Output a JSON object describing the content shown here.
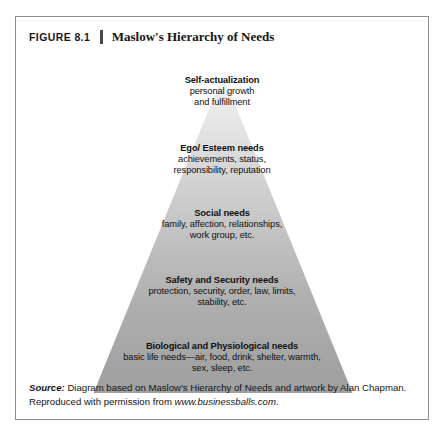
{
  "figure": {
    "number": "FIGURE 8.1",
    "title": "Maslow's Hierarchy of Needs"
  },
  "pyramid": {
    "tiers": [
      {
        "id": "self-actualization",
        "title": "Self-actualization",
        "description": "personal growth\nand fulfillment",
        "fill": "#e9e9e9"
      },
      {
        "id": "ego-esteem",
        "title": "Ego/ Esteem needs",
        "description": "achievements, status,\nresponsibility, reputation",
        "fill": "#d2d2d2"
      },
      {
        "id": "social",
        "title": "Social needs",
        "description": "family, affection, relationships,\nwork group, etc.",
        "fill": "#bcbcbc"
      },
      {
        "id": "safety-security",
        "title": "Safety and Security needs",
        "description": "protection, security, order, law, limits,\nstability, etc.",
        "fill": "#ababab"
      },
      {
        "id": "biological-physiological",
        "title": "Biological and Physiological needs",
        "description": "basic life needs—air, food, drink, shelter, warmth,\nsex, sleep, etc.",
        "fill": "#9f9f9f"
      }
    ]
  },
  "source": {
    "label": "Source:",
    "line1": " Diagram based on Maslow's Hierarchy of Needs and artwork by Alan Chapman.",
    "line2_prefix": "Reproduced with permission from ",
    "url": "www.businessballs.com",
    "line2_suffix": "."
  },
  "colors": {
    "frame_border": "#8e8e8e",
    "text": "#111111",
    "page_background": "#ffffff"
  }
}
